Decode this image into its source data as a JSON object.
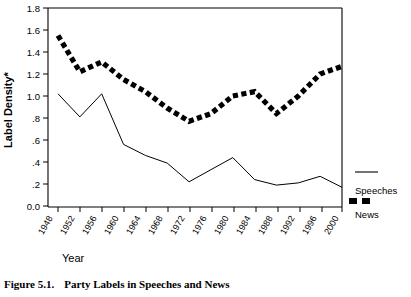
{
  "figure": {
    "caption_number": "Figure 5.1.",
    "caption_text": "Party Labels in Speeches and News"
  },
  "chart_data": {
    "type": "line",
    "title": "",
    "xlabel": "Year",
    "ylabel": "Label Density*",
    "categories": [
      "1948",
      "1952",
      "1956",
      "1960",
      "1964",
      "1968",
      "1972",
      "1976",
      "1980",
      "1984",
      "1988",
      "1992",
      "1996",
      "2000"
    ],
    "ylim": [
      0.0,
      1.8
    ],
    "ytick_labels": [
      "1.8",
      "1.6",
      "1.4",
      "1.2",
      "1.0",
      ".8",
      ".6",
      ".4",
      ".2",
      "0.0"
    ],
    "ytick_values": [
      1.8,
      1.6,
      1.4,
      1.2,
      1.0,
      0.8,
      0.6,
      0.4,
      0.2,
      0.0
    ],
    "grid": false,
    "legend_position": "right",
    "series": [
      {
        "name": "Speeches",
        "style": "thin-solid-line",
        "color": "#000000",
        "values": [
          1.02,
          0.81,
          1.02,
          0.56,
          0.46,
          0.39,
          0.22,
          0.33,
          0.44,
          0.24,
          0.19,
          0.21,
          0.27,
          0.17
        ]
      },
      {
        "name": "News",
        "style": "thick-dashed-line",
        "color": "#000000",
        "values": [
          1.55,
          1.22,
          1.31,
          1.15,
          1.04,
          0.89,
          0.77,
          0.84,
          1.0,
          1.04,
          0.84,
          1.0,
          1.2,
          1.27
        ]
      }
    ]
  },
  "legend": {
    "items": [
      {
        "label": "Speeches",
        "swatch": "thin-line-swatch"
      },
      {
        "label": "News",
        "swatch": "dashed-block-swatch"
      }
    ]
  },
  "colors": {
    "ink": "#000000",
    "paper": "#ffffff"
  }
}
